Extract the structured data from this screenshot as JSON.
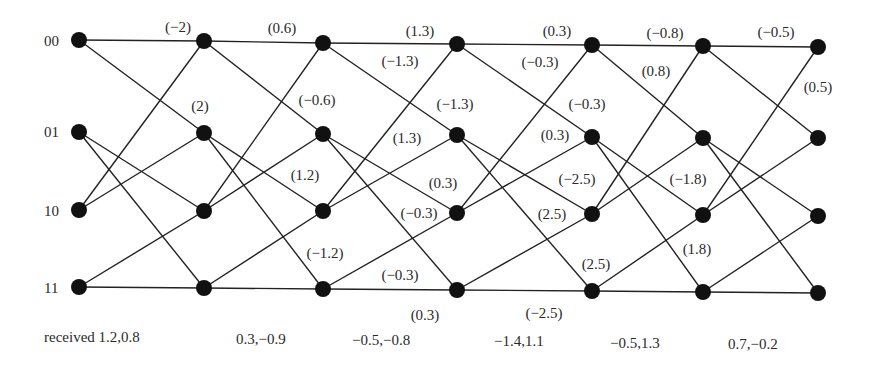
{
  "diagram": {
    "type": "trellis",
    "states": [
      "00",
      "01",
      "10",
      "11"
    ],
    "columns_x": [
      79,
      204,
      323,
      457,
      592,
      703,
      818
    ],
    "rows_y": [
      [
        40,
        132,
        210,
        287
      ],
      [
        41,
        133,
        211,
        288
      ],
      [
        43,
        134,
        211,
        289
      ],
      [
        44,
        135,
        213,
        290
      ],
      [
        45,
        137,
        214,
        291
      ],
      [
        46,
        138,
        215,
        292
      ],
      [
        47,
        138,
        216,
        293
      ]
    ],
    "transitions": [
      [
        0,
        0
      ],
      [
        0,
        1
      ],
      [
        1,
        2
      ],
      [
        1,
        3
      ],
      [
        2,
        0
      ],
      [
        2,
        1
      ],
      [
        3,
        2
      ],
      [
        3,
        3
      ]
    ],
    "colors": {
      "line": "#222222",
      "node": "#111111"
    }
  },
  "state_labels": [
    {
      "text": "00",
      "x": 44,
      "y": 41
    },
    {
      "text": "01",
      "x": 44,
      "y": 132
    },
    {
      "text": "10",
      "x": 44,
      "y": 211
    },
    {
      "text": "11",
      "x": 44,
      "y": 288
    }
  ],
  "edge_labels": [
    {
      "text": "(−2)",
      "x": 178,
      "y": 27
    },
    {
      "text": "(2)",
      "x": 200,
      "y": 106
    },
    {
      "text": "(0.6)",
      "x": 282,
      "y": 28
    },
    {
      "text": "(−0.6)",
      "x": 317,
      "y": 100
    },
    {
      "text": "(1.2)",
      "x": 305,
      "y": 175
    },
    {
      "text": "(−1.2)",
      "x": 325,
      "y": 253
    },
    {
      "text": "(1.3)",
      "x": 420,
      "y": 31
    },
    {
      "text": "(−1.3)",
      "x": 400,
      "y": 61
    },
    {
      "text": "(−1.3)",
      "x": 455,
      "y": 104
    },
    {
      "text": "(1.3)",
      "x": 407,
      "y": 138
    },
    {
      "text": "(0.3)",
      "x": 443,
      "y": 183
    },
    {
      "text": "(−0.3)",
      "x": 419,
      "y": 213
    },
    {
      "text": "(−0.3)",
      "x": 400,
      "y": 275
    },
    {
      "text": "(0.3)",
      "x": 425,
      "y": 315
    },
    {
      "text": "(0.3)",
      "x": 557,
      "y": 31
    },
    {
      "text": "(−0.3)",
      "x": 540,
      "y": 62
    },
    {
      "text": "(−0.3)",
      "x": 587,
      "y": 104
    },
    {
      "text": "(0.3)",
      "x": 555,
      "y": 135
    },
    {
      "text": "(−2.5)",
      "x": 577,
      "y": 179
    },
    {
      "text": "(2.5)",
      "x": 552,
      "y": 214
    },
    {
      "text": "(2.5)",
      "x": 596,
      "y": 264
    },
    {
      "text": "(−2.5)",
      "x": 544,
      "y": 313
    },
    {
      "text": "(−0.8)",
      "x": 665,
      "y": 33
    },
    {
      "text": "(0.8)",
      "x": 656,
      "y": 71
    },
    {
      "text": "(−1.8)",
      "x": 688,
      "y": 179
    },
    {
      "text": "(1.8)",
      "x": 697,
      "y": 249
    },
    {
      "text": "(−0.5)",
      "x": 776,
      "y": 32
    },
    {
      "text": "(0.5)",
      "x": 818,
      "y": 87
    }
  ],
  "received": [
    {
      "text": "received 1.2,0.8",
      "x": 44,
      "y": 337
    },
    {
      "text": "0.3,−0.9",
      "x": 236,
      "y": 339
    },
    {
      "text": "−0.5,−0.8",
      "x": 352,
      "y": 340
    },
    {
      "text": "−1.4,1.1",
      "x": 494,
      "y": 341
    },
    {
      "text": "−0.5,1.3",
      "x": 610,
      "y": 343
    },
    {
      "text": "0.7,−0.2",
      "x": 728,
      "y": 344
    }
  ]
}
